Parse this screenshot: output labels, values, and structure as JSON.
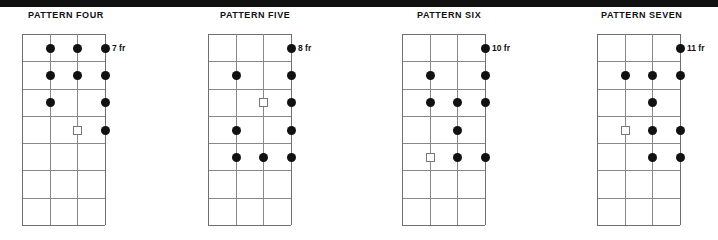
{
  "meta": {
    "top_band_color": "#111111",
    "background_color": "#ffffff",
    "dot_color": "#111111",
    "grid_color": "#888888",
    "string_count": 4,
    "fret_count": 7
  },
  "patterns": [
    {
      "title": "PATTERN FOUR",
      "fret_label": "7 fr",
      "title_x": 28,
      "grid_x": 22,
      "label_x": 112,
      "markers": [
        {
          "string": 2,
          "fret": 1,
          "type": "dot"
        },
        {
          "string": 3,
          "fret": 1,
          "type": "dot"
        },
        {
          "string": 4,
          "fret": 1,
          "type": "dot"
        },
        {
          "string": 2,
          "fret": 2,
          "type": "dot"
        },
        {
          "string": 3,
          "fret": 2,
          "type": "dot"
        },
        {
          "string": 4,
          "fret": 2,
          "type": "dot"
        },
        {
          "string": 2,
          "fret": 3,
          "type": "dot"
        },
        {
          "string": 4,
          "fret": 3,
          "type": "dot"
        },
        {
          "string": 3,
          "fret": 4,
          "type": "root"
        },
        {
          "string": 4,
          "fret": 4,
          "type": "dot"
        }
      ]
    },
    {
      "title": "PATTERN FIVE",
      "fret_label": "8 fr",
      "title_x": 220,
      "grid_x": 208,
      "label_x": 298,
      "markers": [
        {
          "string": 4,
          "fret": 1,
          "type": "dot"
        },
        {
          "string": 2,
          "fret": 2,
          "type": "dot"
        },
        {
          "string": 4,
          "fret": 2,
          "type": "dot"
        },
        {
          "string": 3,
          "fret": 3,
          "type": "root"
        },
        {
          "string": 4,
          "fret": 3,
          "type": "dot"
        },
        {
          "string": 2,
          "fret": 4,
          "type": "dot"
        },
        {
          "string": 4,
          "fret": 4,
          "type": "dot"
        },
        {
          "string": 2,
          "fret": 5,
          "type": "dot"
        },
        {
          "string": 3,
          "fret": 5,
          "type": "dot"
        },
        {
          "string": 4,
          "fret": 5,
          "type": "dot"
        }
      ]
    },
    {
      "title": "PATTERN SIX",
      "fret_label": "10 fr",
      "title_x": 417,
      "grid_x": 402,
      "label_x": 492,
      "markers": [
        {
          "string": 4,
          "fret": 1,
          "type": "dot"
        },
        {
          "string": 2,
          "fret": 2,
          "type": "dot"
        },
        {
          "string": 4,
          "fret": 2,
          "type": "dot"
        },
        {
          "string": 2,
          "fret": 3,
          "type": "dot"
        },
        {
          "string": 3,
          "fret": 3,
          "type": "dot"
        },
        {
          "string": 4,
          "fret": 3,
          "type": "dot"
        },
        {
          "string": 3,
          "fret": 4,
          "type": "dot"
        },
        {
          "string": 2,
          "fret": 5,
          "type": "root"
        },
        {
          "string": 3,
          "fret": 5,
          "type": "dot"
        },
        {
          "string": 4,
          "fret": 5,
          "type": "dot"
        }
      ]
    },
    {
      "title": "PATTERN SEVEN",
      "fret_label": "11 fr",
      "title_x": 601,
      "grid_x": 597,
      "label_x": 687,
      "markers": [
        {
          "string": 4,
          "fret": 1,
          "type": "dot"
        },
        {
          "string": 2,
          "fret": 2,
          "type": "dot"
        },
        {
          "string": 3,
          "fret": 2,
          "type": "dot"
        },
        {
          "string": 4,
          "fret": 2,
          "type": "dot"
        },
        {
          "string": 3,
          "fret": 3,
          "type": "dot"
        },
        {
          "string": 2,
          "fret": 4,
          "type": "root"
        },
        {
          "string": 3,
          "fret": 4,
          "type": "dot"
        },
        {
          "string": 4,
          "fret": 4,
          "type": "dot"
        },
        {
          "string": 3,
          "fret": 5,
          "type": "dot"
        },
        {
          "string": 4,
          "fret": 5,
          "type": "dot"
        }
      ]
    }
  ]
}
